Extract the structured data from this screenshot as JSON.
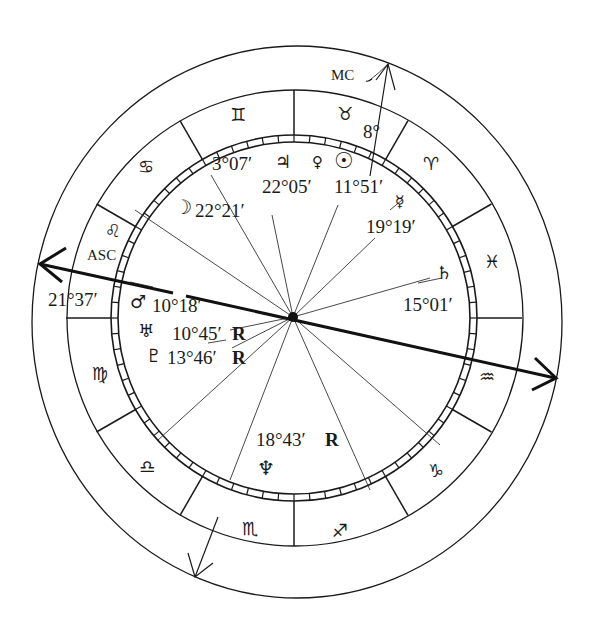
{
  "chart_data": {
    "type": "natal-chart-wheel",
    "signs": [
      {
        "name": "Aries",
        "glyph": "♈"
      },
      {
        "name": "Taurus",
        "glyph": "♉"
      },
      {
        "name": "Gemini",
        "glyph": "♊"
      },
      {
        "name": "Cancer",
        "glyph": "♋"
      },
      {
        "name": "Leo",
        "glyph": "♌"
      },
      {
        "name": "Virgo",
        "glyph": "♍"
      },
      {
        "name": "Libra",
        "glyph": "♎"
      },
      {
        "name": "Scorpio",
        "glyph": "♏"
      },
      {
        "name": "Sagittarius",
        "glyph": "♐"
      },
      {
        "name": "Capricorn",
        "glyph": "♑"
      },
      {
        "name": "Aquarius",
        "glyph": "♒"
      },
      {
        "name": "Pisces",
        "glyph": "♓"
      }
    ],
    "angles": {
      "asc": {
        "label": "ASC",
        "degree": "21°37′"
      },
      "mc": {
        "label": "MC",
        "degree": "8°"
      }
    },
    "planets": [
      {
        "name": "Jupiter",
        "glyph": "♃",
        "degree": "3°07′",
        "retrograde": false
      },
      {
        "name": "Venus",
        "glyph": "♀",
        "degree": "22°05′",
        "retrograde": false
      },
      {
        "name": "Sun",
        "glyph": "☉",
        "degree": "11°51′",
        "retrograde": false
      },
      {
        "name": "Mercury",
        "glyph": "☿",
        "degree": "19°19′",
        "retrograde": false
      },
      {
        "name": "Moon",
        "glyph": "☽",
        "degree": "22°21′",
        "retrograde": false
      },
      {
        "name": "Saturn",
        "glyph": "♄",
        "degree": "15°01′",
        "retrograde": false
      },
      {
        "name": "Mars",
        "glyph": "♂",
        "degree": "10°18′",
        "retrograde": false
      },
      {
        "name": "Uranus",
        "glyph": "♅",
        "degree": "10°45′",
        "retrograde": true
      },
      {
        "name": "Pluto",
        "glyph": "♇",
        "degree": "13°46′",
        "retrograde": true
      },
      {
        "name": "Neptune",
        "glyph": "♆",
        "degree": "18°43′",
        "retrograde": true
      }
    ],
    "retrograde_mark": "R"
  },
  "labels": {
    "gemini": "♊",
    "taurus": "♉",
    "aries": "♈",
    "pisces": "♓",
    "aquarius": "♒",
    "capricorn": "♑",
    "sagittarius": "♐",
    "scorpio": "♏",
    "libra": "♎",
    "virgo": "♍",
    "leo": "♌",
    "cancer": "♋",
    "mc": "MC",
    "mc_deg": "8°",
    "asc": "ASC",
    "asc_deg": "21°37′",
    "jupiter": "♃",
    "jupiter_deg": "3°07′",
    "venus": "♀",
    "venus_deg": "22°05′",
    "sun": "☉",
    "sun_deg": "11°51′",
    "mercury": "☿",
    "mercury_deg": "19°19′",
    "moon": "☽",
    "moon_deg": "22°21′",
    "saturn": "♄",
    "saturn_deg": "15°01′",
    "mars": "♂",
    "mars_deg": "10°18′",
    "uranus": "♅",
    "uranus_deg": "10°45′",
    "pluto": "♇",
    "pluto_deg": "13°46′",
    "neptune": "♆",
    "neptune_deg": "18°43′",
    "r": "R"
  }
}
